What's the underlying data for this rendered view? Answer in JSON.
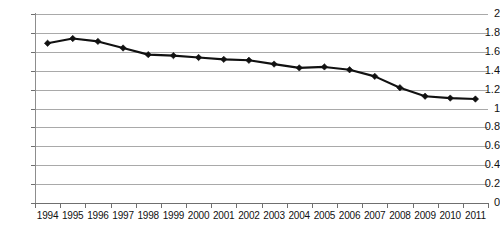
{
  "chart_data": {
    "type": "line",
    "title": "",
    "subtitle": "",
    "xlabel": "",
    "ylabel": "",
    "categories": [
      "1994",
      "1995",
      "1996",
      "1997",
      "1998",
      "1999",
      "2000",
      "2001",
      "2002",
      "2003",
      "2004",
      "2005",
      "2006",
      "2007",
      "2008",
      "2009",
      "2010",
      "2011"
    ],
    "values": [
      1.69,
      1.74,
      1.71,
      1.64,
      1.57,
      1.56,
      1.54,
      1.52,
      1.51,
      1.47,
      1.43,
      1.44,
      1.41,
      1.34,
      1.22,
      1.13,
      1.11,
      1.1
    ],
    "series": [
      {
        "name": "",
        "values": [
          1.69,
          1.74,
          1.71,
          1.64,
          1.57,
          1.56,
          1.54,
          1.52,
          1.51,
          1.47,
          1.43,
          1.44,
          1.41,
          1.34,
          1.22,
          1.13,
          1.11,
          1.1
        ]
      }
    ],
    "ylim": [
      0,
      2
    ],
    "ytick_values": [
      0,
      0.2,
      0.4,
      0.6,
      0.8,
      1,
      1.2,
      1.4,
      1.6,
      1.8,
      2
    ],
    "ytick_labels": [
      "0",
      "0.2",
      "0.4",
      "0.6",
      "0.8",
      "1",
      "1.2",
      "1.4",
      "1.6",
      "1.8",
      "2"
    ],
    "grid": true,
    "grid_axis": "y",
    "legend": false,
    "legend_position": "none",
    "marker": "diamond",
    "line_color": "#111111",
    "marker_color": "#111111",
    "grid_color": "#9a9a9a",
    "background_color": "#ffffff",
    "annotations": []
  }
}
